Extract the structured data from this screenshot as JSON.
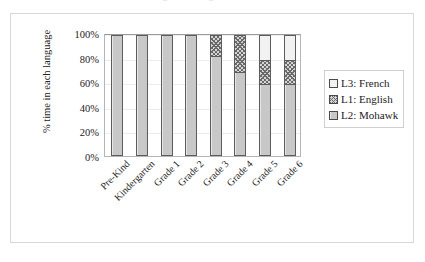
{
  "top_cut_fragments": [
    "a",
    "g",
    "g"
  ],
  "chart_data": {
    "type": "bar",
    "subtype": "stacked-100-percent",
    "title": "",
    "xlabel": "",
    "ylabel": "% time in each language",
    "ylim": [
      0,
      100
    ],
    "yticks": [
      0,
      20,
      40,
      60,
      80,
      100
    ],
    "ytick_labels": [
      "0%",
      "20%",
      "40%",
      "60%",
      "80%",
      "100%"
    ],
    "grid": true,
    "legend_position": "right",
    "categories": [
      "Pre-Kind",
      "Kindergarten",
      "Grade 1",
      "Grade 2",
      "Grade 3",
      "Grade 4",
      "Grade 5",
      "Grade 6"
    ],
    "series": [
      {
        "name": "L2: Mohawk",
        "fill": "solid-light-gray",
        "color": "#c8c8c8",
        "values": [
          100,
          100,
          100,
          100,
          83,
          70,
          60,
          60
        ]
      },
      {
        "name": "L1: English",
        "fill": "crosshatch",
        "color": "#6a6a6a",
        "values": [
          0,
          0,
          0,
          0,
          17,
          30,
          20,
          20
        ]
      },
      {
        "name": "L3: French",
        "fill": "white",
        "color": "#f2f2f2",
        "values": [
          0,
          0,
          0,
          0,
          0,
          0,
          20,
          20
        ]
      }
    ],
    "legend_entries": [
      {
        "label": "L3: French",
        "fill": "white"
      },
      {
        "label": "L1: English",
        "fill": "crosshatch"
      },
      {
        "label": "L2: Mohawk",
        "fill": "solid-light-gray"
      }
    ]
  }
}
